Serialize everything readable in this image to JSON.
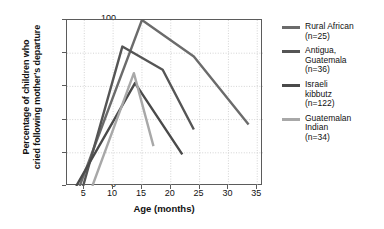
{
  "chart_data": {
    "type": "line",
    "title": "",
    "xlabel": "Age (months)",
    "ylabel": "Percentage of children who cried following mother's departure",
    "ylabel_lines": [
      "Percentage of children who",
      "cried following mother's departure"
    ],
    "xlim": [
      2,
      36
    ],
    "ylim": [
      0,
      100
    ],
    "xticks": [
      5,
      10,
      15,
      20,
      25,
      30,
      35
    ],
    "yticks": [
      0,
      20,
      40,
      60,
      80,
      100
    ],
    "grid": true,
    "legend_position": "right",
    "series": [
      {
        "name": "Rural African",
        "n_label": "(n=25)",
        "color": "#6b6b6b",
        "legend_lines": [
          "Rural African",
          "(n=25)"
        ],
        "points": [
          [
            4.2,
            0
          ],
          [
            15.0,
            100
          ],
          [
            24.0,
            78
          ],
          [
            33.5,
            37
          ]
        ]
      },
      {
        "name": "Antigua, Guatemala",
        "n_label": "(n=36)",
        "color": "#555555",
        "legend_lines": [
          "Antigua,",
          "Guatemala",
          "(n=36)"
        ],
        "points": [
          [
            4.8,
            0
          ],
          [
            11.6,
            84
          ],
          [
            18.6,
            70
          ],
          [
            24.0,
            34
          ]
        ]
      },
      {
        "name": "Israeli kibbutz",
        "n_label": "(n=122)",
        "color": "#4a4a4a",
        "legend_lines": [
          "Israeli",
          "kibbutz",
          "(n=122)"
        ],
        "points": [
          [
            3.6,
            0
          ],
          [
            13.8,
            62
          ],
          [
            22.0,
            19
          ]
        ]
      },
      {
        "name": "Guatemalan Indian",
        "n_label": "(n=34)",
        "color": "#a8a8a8",
        "legend_lines": [
          "Guatemalan",
          "Indian",
          "(n=34)"
        ],
        "points": [
          [
            6.4,
            0
          ],
          [
            13.6,
            68
          ],
          [
            17.0,
            24
          ]
        ]
      }
    ]
  },
  "axes": {
    "x_title": "Age (months)",
    "y_title_line1": "Percentage of children who",
    "y_title_line2": "cried following mother's departure",
    "x_tick_labels": [
      "5",
      "10",
      "15",
      "20",
      "25",
      "30",
      "35"
    ],
    "y_tick_labels": [
      "0",
      "20",
      "40",
      "60",
      "80",
      "100"
    ]
  },
  "legend": {
    "items": [
      {
        "line1": "Rural African",
        "line2": "(n=25)",
        "line3": "",
        "color": "#6b6b6b"
      },
      {
        "line1": "Antigua,",
        "line2": "Guatemala",
        "line3": "(n=36)",
        "color": "#555555"
      },
      {
        "line1": "Israeli",
        "line2": "kibbutz",
        "line3": "(n=122)",
        "color": "#4a4a4a"
      },
      {
        "line1": "Guatemalan",
        "line2": "Indian",
        "line3": "(n=34)",
        "color": "#a8a8a8"
      }
    ]
  }
}
